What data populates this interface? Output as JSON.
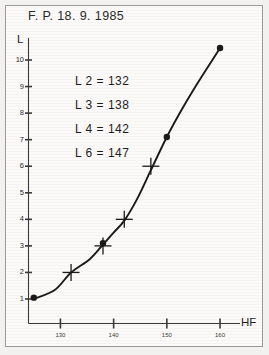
{
  "title": "F. P. 18. 9. 1985",
  "annotations": [
    {
      "label": "L 2 =",
      "value": "132",
      "text": "L 2 = 132"
    },
    {
      "label": "L 3 =",
      "value": "138",
      "text": "L 3 = 138"
    },
    {
      "label": "L 4 =",
      "value": "142",
      "text": "L 4 = 142"
    },
    {
      "label": "L 6 =",
      "value": "147",
      "text": "L 6 = 147"
    }
  ],
  "axes": {
    "y_name": "L",
    "x_name": "HF"
  },
  "colors": {
    "paper": "#fbfaf8",
    "page": "#f2f1ef",
    "ink": "#1a1a1a",
    "axis": "#3a3a3a",
    "frame": "#9a9a96"
  },
  "chart_data": {
    "type": "line",
    "title": "F. P. 18. 9. 1985",
    "xlabel": "HF",
    "ylabel": "L",
    "xlim": [
      124,
      163
    ],
    "ylim": [
      0,
      11
    ],
    "xticks": [
      130,
      140,
      150,
      160
    ],
    "xtick_labels": [
      "130",
      "140",
      "150",
      "160"
    ],
    "yticks": [
      1,
      2,
      3,
      4,
      5,
      6,
      7,
      8,
      9,
      10
    ],
    "ytick_labels": [
      "1",
      "2",
      "3",
      "4",
      "5",
      "6",
      "7",
      "8",
      "9",
      "10"
    ],
    "grid": false,
    "legend": false,
    "annotations": [
      "L 2 = 132",
      "L 3 = 138",
      "L 4 = 142",
      "L 6 = 147"
    ],
    "series": [
      {
        "name": "curve",
        "style": "smooth-line",
        "x": [
          125.0,
          129.0,
          132.0,
          135.5,
          138.0,
          140.0,
          142.0,
          144.5,
          147.0,
          150.0,
          153.0,
          156.0,
          160.0
        ],
        "y": [
          1.0,
          1.35,
          2.0,
          2.5,
          3.05,
          3.5,
          3.95,
          4.8,
          5.85,
          7.1,
          8.2,
          9.2,
          10.45
        ]
      },
      {
        "name": "measured-points",
        "style": "filled-dot",
        "x": [
          125.0,
          138.0,
          150.0,
          160.0
        ],
        "y": [
          1.05,
          3.1,
          7.1,
          10.45
        ]
      },
      {
        "name": "cross-markers",
        "style": "plus",
        "x": [
          132.0,
          138.0,
          142.0,
          147.0
        ],
        "y": [
          2.0,
          3.0,
          4.0,
          6.0
        ]
      }
    ]
  }
}
